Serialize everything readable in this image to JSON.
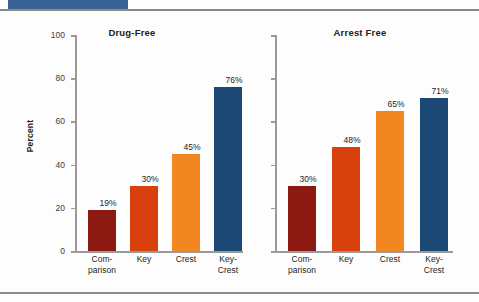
{
  "accent_color": "#3a6196",
  "axis": {
    "y_title": "Percent",
    "y_ticks": [
      "100",
      "80",
      "60",
      "40",
      "20",
      "0"
    ]
  },
  "chart_data": {
    "type": "bar",
    "title": "",
    "xlabel": "",
    "ylabel": "Percent",
    "ylim": [
      0,
      100
    ],
    "grid": false,
    "legend": "none",
    "categories": [
      "Com-\nparison",
      "Key",
      "Crest",
      "Key-\nCrest"
    ],
    "category_labels": [
      {
        "line1": "Com-",
        "line2": "parison"
      },
      {
        "line1": "Key",
        "line2": ""
      },
      {
        "line1": "Crest",
        "line2": ""
      },
      {
        "line1": "Key-",
        "line2": "Crest"
      }
    ],
    "series_colors": [
      "#8d1a12",
      "#d8410d",
      "#f28620",
      "#1b4875"
    ],
    "panels": [
      {
        "title": "Drug-Free",
        "values": [
          19,
          30,
          45,
          76
        ],
        "value_labels": [
          "19%",
          "30%",
          "45%",
          "76%"
        ]
      },
      {
        "title": "Arrest Free",
        "values": [
          30,
          48,
          65,
          71
        ],
        "value_labels": [
          "30%",
          "48%",
          "65%",
          "71%"
        ]
      }
    ]
  }
}
